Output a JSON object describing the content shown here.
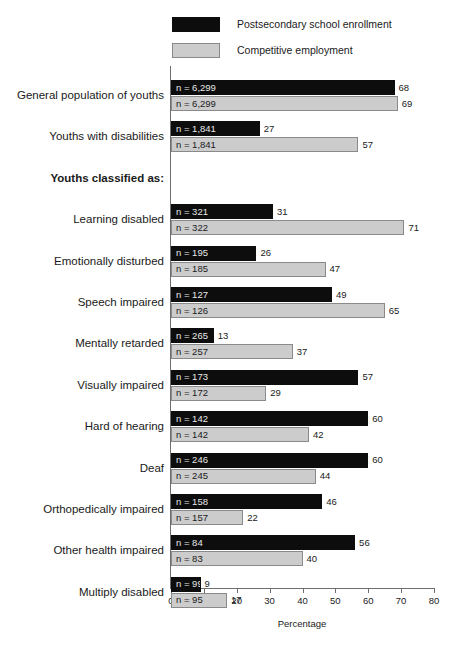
{
  "chart_data": {
    "type": "bar",
    "orientation": "horizontal",
    "title": "",
    "xlabel": "Percentage",
    "ylabel": "",
    "xlim": [
      0,
      80
    ],
    "xticks": [
      0,
      10,
      20,
      30,
      40,
      50,
      60,
      70,
      80
    ],
    "grid": false,
    "legend_position": "top",
    "series": [
      {
        "name": "Postsecondary school enrollment",
        "color": "#0d0d0d",
        "values": [
          68,
          27,
          null,
          31,
          26,
          49,
          13,
          57,
          60,
          60,
          46,
          56,
          9
        ],
        "n_labels": [
          "n = 6,299",
          "n = 1,841",
          null,
          "n = 321",
          "n = 195",
          "n = 127",
          "n = 265",
          "n = 173",
          "n = 142",
          "n = 246",
          "n = 158",
          "n = 84",
          "n = 99"
        ]
      },
      {
        "name": "Competitive employment",
        "color": "#cccccc",
        "values": [
          69,
          57,
          null,
          71,
          47,
          65,
          37,
          29,
          42,
          44,
          22,
          40,
          17
        ],
        "n_labels": [
          "n = 6,299",
          "n = 1,841",
          null,
          "n = 322",
          "n = 185",
          "n = 126",
          "n = 257",
          "n = 172",
          "n = 142",
          "n = 245",
          "n = 157",
          "n = 83",
          "n = 95"
        ]
      }
    ],
    "categories": [
      "General  population of youths",
      "Youths with disabilities",
      "Youths classified as:",
      "Learning disabled",
      "Emotionally disturbed",
      "Speech impaired",
      "Mentally retarded",
      "Visually impaired",
      "Hard of hearing",
      "Deaf",
      "Orthopedically impaired",
      "Other health impaired",
      "Multiply disabled"
    ]
  },
  "legend": {
    "items": [
      {
        "label": "Postsecondary school enrollment",
        "swatch": "dark"
      },
      {
        "label": "Competitive employment",
        "swatch": "light"
      }
    ]
  },
  "axis": {
    "title": "Percentage",
    "tick_labels": [
      "0",
      "10",
      "20",
      "30",
      "40",
      "50",
      "60",
      "70",
      "80"
    ]
  },
  "rows": [
    {
      "label": "General  population of youths",
      "is_heading": false,
      "dark": {
        "value": 68,
        "value_label": "68",
        "n_label": "n = 6,299"
      },
      "light": {
        "value": 69,
        "value_label": "69",
        "n_label": "n = 6,299"
      }
    },
    {
      "label": "Youths with disabilities",
      "is_heading": false,
      "dark": {
        "value": 27,
        "value_label": "27",
        "n_label": "n = 1,841"
      },
      "light": {
        "value": 57,
        "value_label": "57",
        "n_label": "n = 1,841"
      }
    },
    {
      "label": "Youths classified as:",
      "is_heading": true,
      "dark": null,
      "light": null
    },
    {
      "label": "Learning disabled",
      "is_heading": false,
      "dark": {
        "value": 31,
        "value_label": "31",
        "n_label": "n = 321"
      },
      "light": {
        "value": 71,
        "value_label": "71",
        "n_label": "n = 322"
      }
    },
    {
      "label": "Emotionally disturbed",
      "is_heading": false,
      "dark": {
        "value": 26,
        "value_label": "26",
        "n_label": "n = 195"
      },
      "light": {
        "value": 47,
        "value_label": "47",
        "n_label": "n = 185"
      }
    },
    {
      "label": "Speech impaired",
      "is_heading": false,
      "dark": {
        "value": 49,
        "value_label": "49",
        "n_label": "n = 127"
      },
      "light": {
        "value": 65,
        "value_label": "65",
        "n_label": "n = 126"
      }
    },
    {
      "label": "Mentally retarded",
      "is_heading": false,
      "dark": {
        "value": 13,
        "value_label": "13",
        "n_label": "n = 265"
      },
      "light": {
        "value": 37,
        "value_label": "37",
        "n_label": "n = 257"
      }
    },
    {
      "label": "Visually impaired",
      "is_heading": false,
      "dark": {
        "value": 57,
        "value_label": "57",
        "n_label": "n = 173"
      },
      "light": {
        "value": 29,
        "value_label": "29",
        "n_label": "n = 172"
      }
    },
    {
      "label": "Hard of hearing",
      "is_heading": false,
      "dark": {
        "value": 60,
        "value_label": "60",
        "n_label": "n = 142"
      },
      "light": {
        "value": 42,
        "value_label": "42",
        "n_label": "n = 142"
      }
    },
    {
      "label": "Deaf",
      "is_heading": false,
      "dark": {
        "value": 60,
        "value_label": "60",
        "n_label": "n = 246"
      },
      "light": {
        "value": 44,
        "value_label": "44",
        "n_label": "n = 245"
      }
    },
    {
      "label": "Orthopedically impaired",
      "is_heading": false,
      "dark": {
        "value": 46,
        "value_label": "46",
        "n_label": "n = 158"
      },
      "light": {
        "value": 22,
        "value_label": "22",
        "n_label": "n = 157"
      }
    },
    {
      "label": "Other health impaired",
      "is_heading": false,
      "dark": {
        "value": 56,
        "value_label": "56",
        "n_label": "n = 84"
      },
      "light": {
        "value": 40,
        "value_label": "40",
        "n_label": "n = 83"
      }
    },
    {
      "label": "Multiply disabled",
      "is_heading": false,
      "dark": {
        "value": 9,
        "value_label": "9",
        "n_label": "n = 99"
      },
      "light": {
        "value": 17,
        "value_label": "17",
        "n_label": "n = 95"
      }
    }
  ]
}
